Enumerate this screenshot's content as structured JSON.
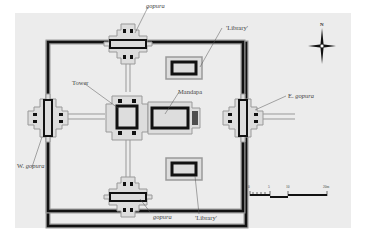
{
  "diagram": {
    "type": "architectural-plan",
    "labels": {
      "gopura_north": "gopura",
      "gopura_south": "gopura",
      "west_gopura_prefix": "W.",
      "west_gopura": "gopura",
      "east_gopura_prefix": "E.",
      "east_gopura": "gopura",
      "library_north": "'Library'",
      "library_south": "'Library'",
      "tower": "Tower",
      "mandapa": "Mandapa"
    },
    "north_arrow": {
      "label": "N"
    },
    "scale_bar": {
      "ticks": [
        "0",
        "5",
        "10",
        "20m"
      ]
    },
    "colors": {
      "background": "#ececec",
      "wall": "#111111",
      "outline": "#9a9a9a"
    }
  }
}
